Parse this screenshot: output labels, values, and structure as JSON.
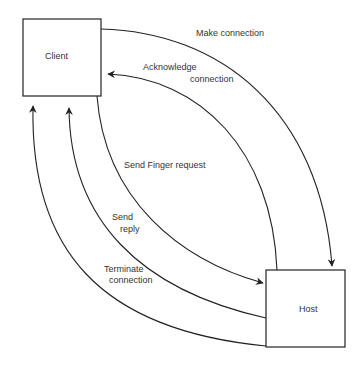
{
  "nodes": {
    "client": {
      "label": "Client"
    },
    "host": {
      "label": "Host"
    }
  },
  "edges": {
    "make_connection": {
      "label": "Make connection"
    },
    "acknowledge_connection": {
      "line1": "Acknowledge",
      "line2": "connection"
    },
    "send_finger_request": {
      "label": "Send Finger request"
    },
    "send_reply": {
      "line1": "Send",
      "line2": "reply"
    },
    "terminate_connection": {
      "line1": "Terminate",
      "line2": "connection"
    }
  },
  "colors": {
    "stroke": "#222222",
    "text": "#333333",
    "background": "#ffffff"
  }
}
